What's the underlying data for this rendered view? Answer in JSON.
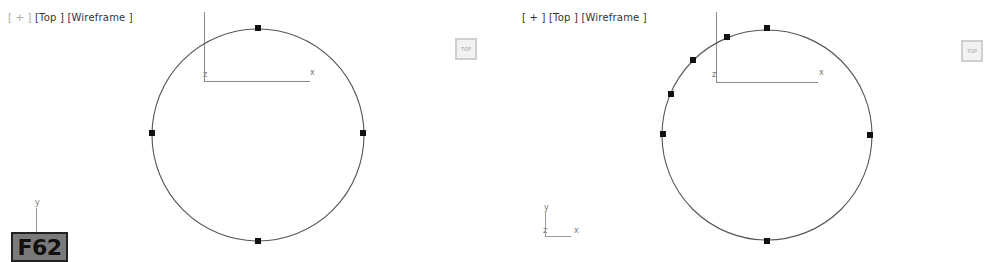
{
  "viewports": [
    {
      "id": "left",
      "label": {
        "plus": "[ + ]",
        "view": "[Top ]",
        "shading": "[Wireframe ]"
      },
      "plus_active": false,
      "viewcube_label": "TOP",
      "grid_axes": {
        "x": "x",
        "z": "z"
      },
      "corner_axes": {
        "x": "x",
        "y": "y",
        "z": "z"
      },
      "circle": {
        "cx": 258,
        "cy": 135,
        "r": 106
      },
      "vertices": [
        [
          258,
          28
        ],
        [
          363,
          133
        ],
        [
          258,
          241
        ],
        [
          152,
          133
        ]
      ]
    },
    {
      "id": "right",
      "label": {
        "plus": "[ + ]",
        "view": "[Top ]",
        "shading": "[Wireframe ]"
      },
      "plus_active": true,
      "viewcube_label": "TOP",
      "grid_axes": {
        "x": "x",
        "z": "z"
      },
      "corner_axes": {
        "x": "x",
        "y": "y",
        "z": "z"
      },
      "circle": {
        "cx": 767,
        "cy": 135,
        "r": 105
      },
      "vertices": [
        [
          767,
          28
        ],
        [
          870,
          135
        ],
        [
          767,
          241
        ],
        [
          663,
          134
        ],
        [
          727,
          37
        ],
        [
          693,
          60
        ],
        [
          671,
          94
        ]
      ]
    }
  ],
  "figure_badge": "F62",
  "colors": {
    "background": "#ffffff",
    "spline": "#555555",
    "vertex": "#111111",
    "grid_axis": "#888888",
    "badge_bg": "#7a7a7a"
  }
}
